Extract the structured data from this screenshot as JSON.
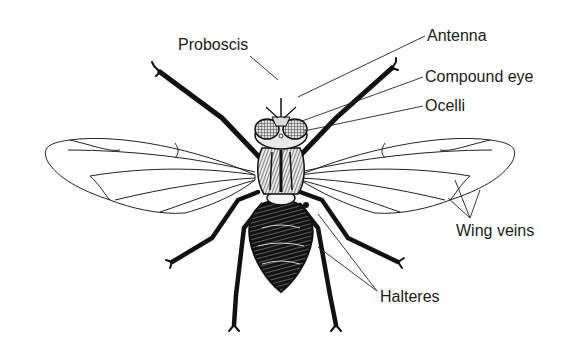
{
  "diagram": {
    "background_color": "#ffffff",
    "ink_color": "#1a1a1a",
    "labels": [
      {
        "id": "proboscis",
        "text": "Proboscis",
        "x": 178,
        "y": 36
      },
      {
        "id": "antenna",
        "text": "Antenna",
        "x": 427,
        "y": 27
      },
      {
        "id": "compound-eye",
        "text": "Compound eye",
        "x": 425,
        "y": 68
      },
      {
        "id": "ocelli",
        "text": "Ocelli",
        "x": 425,
        "y": 97
      },
      {
        "id": "wing-veins",
        "text": "Wing veins",
        "x": 456,
        "y": 222
      },
      {
        "id": "halteres",
        "text": "Halteres",
        "x": 380,
        "y": 288
      }
    ],
    "leaders": {
      "proboscis": [
        [
          250,
          56
        ],
        [
          278,
          80
        ]
      ],
      "antenna": [
        [
          425,
          36
        ],
        [
          298,
          97
        ]
      ],
      "compound-eye": [
        [
          423,
          77
        ],
        [
          302,
          121
        ]
      ],
      "ocelli": [
        [
          423,
          106
        ],
        [
          304,
          131
        ]
      ],
      "wing-veins": [
        [
          [
            470,
            218
          ],
          [
            455,
            180
          ]
        ],
        [
          [
            470,
            218
          ],
          [
            480,
            190
          ]
        ],
        [
          [
            470,
            218
          ],
          [
            448,
            198
          ]
        ]
      ],
      "halteres": [
        [
          [
            377,
            291
          ],
          [
            318,
            214
          ]
        ],
        [
          [
            377,
            291
          ],
          [
            318,
            247
          ]
        ]
      ]
    }
  }
}
